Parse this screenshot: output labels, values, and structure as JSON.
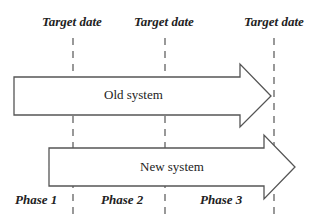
{
  "diagram": {
    "target_labels": [
      "Target date",
      "Target date",
      "Target date"
    ],
    "arrows": [
      {
        "label": "Old system"
      },
      {
        "label": "New system"
      }
    ],
    "phase_labels": [
      "Phase 1",
      "Phase 2",
      "Phase 3"
    ],
    "colors": {
      "stroke": "#555555",
      "text": "#222222",
      "fill": "#ffffff"
    }
  }
}
